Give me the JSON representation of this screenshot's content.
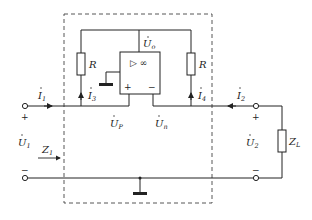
{
  "diagram": {
    "type": "circuit",
    "colors": {
      "wire": "#222222",
      "dashed_box": "#444444",
      "background": "#ffffff"
    },
    "opamp": {
      "symbol": "▷ ∞",
      "plus": "+",
      "minus": "−"
    },
    "labels": {
      "U0": {
        "main": "U",
        "sub": "o"
      },
      "R_left": {
        "main": "R"
      },
      "R_right": {
        "main": "R"
      },
      "I1": {
        "main": "I",
        "sub": "1"
      },
      "I2": {
        "main": "I",
        "sub": "2"
      },
      "I3": {
        "main": "I",
        "sub": "3"
      },
      "I4": {
        "main": "I",
        "sub": "4"
      },
      "UP": {
        "main": "U",
        "sub": "P"
      },
      "Un": {
        "main": "U",
        "sub": "n"
      },
      "U1": {
        "main": "U",
        "sub": "1"
      },
      "U2": {
        "main": "U",
        "sub": "2"
      },
      "Z1": {
        "main": "Z",
        "sub": "1"
      },
      "ZL": {
        "main": "Z",
        "sub": "L"
      },
      "port1_plus": "+",
      "port1_minus": "−",
      "port2_plus": "+",
      "port2_minus": "−"
    }
  }
}
